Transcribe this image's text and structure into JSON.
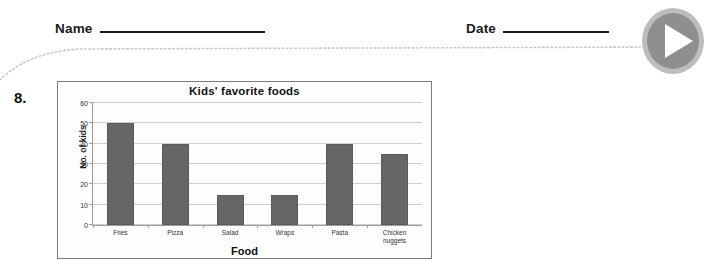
{
  "header": {
    "name_label": "Name",
    "date_label": "Date",
    "name_value": "",
    "date_value": ""
  },
  "play_button": {
    "icon": "play-icon",
    "label": "Play",
    "circle_color": "#8f8f8f",
    "glyph_color": "#ffffff"
  },
  "question": {
    "number": "8."
  },
  "chart_data": {
    "type": "bar",
    "title": "Kids' favorite foods",
    "xlabel": "Food",
    "ylabel": "No. of kids",
    "categories": [
      "Fries",
      "Pizza",
      "Salad",
      "Wraps",
      "Pasta",
      "Chicken nuggets"
    ],
    "values": [
      50,
      40,
      15,
      15,
      40,
      35
    ],
    "ylim": [
      0,
      60
    ],
    "yticks": [
      0,
      10,
      20,
      30,
      40,
      50,
      60
    ],
    "ytick_labels": [
      "0",
      "10",
      "20",
      "30",
      "40",
      "50",
      "60"
    ],
    "grid": true,
    "legend": false,
    "bar_color": "#666666"
  }
}
